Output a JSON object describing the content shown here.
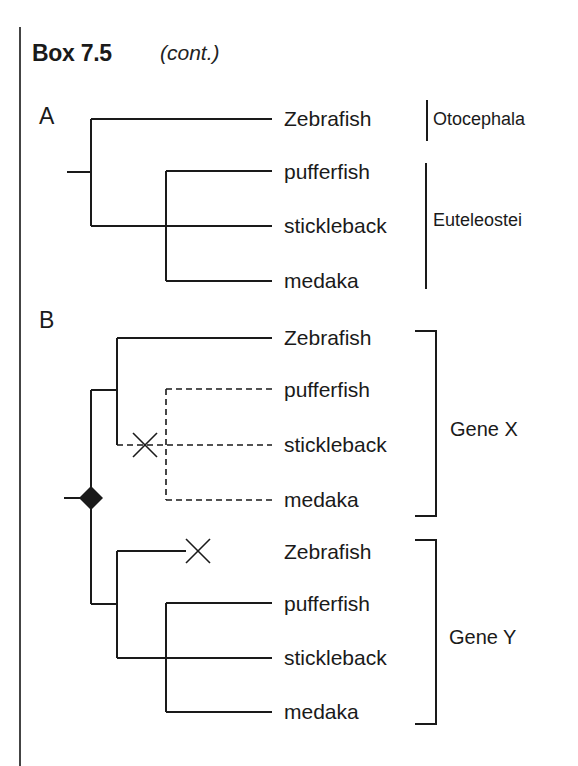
{
  "header": {
    "title": "Box 7.5",
    "subtitle": "(cont.)"
  },
  "panel_a": {
    "label": "A",
    "taxa": [
      "Zebrafish",
      "pufferfish",
      "stickleback",
      "medaka"
    ],
    "clades": [
      {
        "name": "Otocephala",
        "members": [
          "Zebrafish"
        ]
      },
      {
        "name": "Euteleostei",
        "members": [
          "pufferfish",
          "stickleback",
          "medaka"
        ]
      }
    ]
  },
  "panel_b": {
    "label": "B",
    "gene_x": {
      "label": "Gene X",
      "taxa": [
        "Zebrafish",
        "pufferfish",
        "stickleback",
        "medaka"
      ],
      "lost_lineage": "pufferfish + stickleback + medaka (dashed, gene loss)"
    },
    "gene_y": {
      "label": "Gene Y",
      "taxa": [
        "Zebrafish",
        "pufferfish",
        "stickleback",
        "medaka"
      ],
      "lost_lineage": "Zebrafish (gene loss)"
    },
    "markers": {
      "duplication_node": "diamond-icon",
      "gene_loss": "x-mark-icon"
    }
  }
}
